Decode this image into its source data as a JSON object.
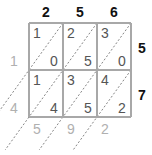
{
  "multiplicand_digits": [
    "2",
    "5",
    "6"
  ],
  "multiplier_digits": [
    "5",
    "7"
  ],
  "cells": [
    [
      {
        "tens": "1",
        "ones": "0"
      },
      {
        "tens": "2",
        "ones": "5"
      },
      {
        "tens": "3",
        "ones": "0"
      }
    ],
    [
      {
        "tens": "1",
        "ones": "4"
      },
      {
        "tens": "3",
        "ones": "5"
      },
      {
        "tens": "4",
        "ones": "2"
      }
    ]
  ],
  "left_result_digits": [
    "1",
    "4"
  ],
  "bottom_result_digits": [
    "5",
    "9",
    "2"
  ],
  "colors": {
    "grid_line": "#a8a8a8",
    "cell_digit": "#555555",
    "header_digit": "#111111",
    "result_digit": "#b0b0b0",
    "diagonal": "#666666"
  }
}
